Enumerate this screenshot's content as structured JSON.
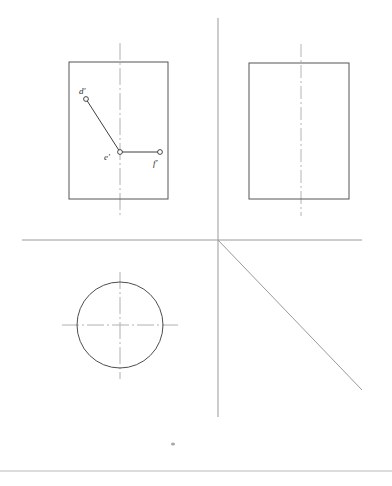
{
  "sheet": {
    "width": 392,
    "height": 486,
    "background": "#ffffff",
    "title": "Orthographic projection — three-view layout with point path d'-e'-f'"
  },
  "colors": {
    "outline": "#555555",
    "axis": "#9a9a9a",
    "centerline": "#b0b0b0",
    "circle": "#4d4d4d",
    "segment": "#3f3f3f",
    "node_fill": "#ffffff",
    "node_stroke": "#333333",
    "label": "#2b2b2b",
    "border": "#b9b9b9",
    "speck": "#a9a9a9"
  },
  "axes": {
    "horizontal": {
      "name": "ground-line",
      "x1": 22,
      "y1": 240,
      "x2": 362,
      "y2": 240
    },
    "vertical": {
      "name": "folding-line",
      "x1": 218,
      "y1": 18,
      "x2": 218,
      "y2": 417
    },
    "miter": {
      "name": "miter-line-45deg",
      "x1": 218,
      "y1": 240,
      "x2": 362,
      "y2": 390,
      "angle_deg": 45
    },
    "origin": {
      "x": 218,
      "y": 240
    }
  },
  "views": {
    "front": {
      "name": "front-view",
      "rect": {
        "x": 69,
        "y": 62,
        "width": 99,
        "height": 137
      },
      "centerline": {
        "x": 120,
        "y1": 43,
        "y2": 216
      }
    },
    "side": {
      "name": "side-view",
      "rect": {
        "x": 249,
        "y": 63,
        "width": 100,
        "height": 136
      },
      "centerline": {
        "x": 301,
        "y1": 44,
        "y2": 216
      }
    },
    "top": {
      "name": "top-view",
      "circle": {
        "cx": 120,
        "cy": 325,
        "r": 43
      },
      "centerline_v": {
        "x": 120,
        "y1": 272,
        "y2": 379
      },
      "centerline_h": {
        "y": 325,
        "x1": 62,
        "x2": 178
      }
    }
  },
  "points": [
    {
      "id": "d-prime",
      "label": "d'",
      "x": 86,
      "y": 99,
      "label_x": 79,
      "label_y": 94,
      "radius": 2.4
    },
    {
      "id": "e-prime",
      "label": "e'",
      "x": 120,
      "y": 152,
      "label_x": 104,
      "label_y": 160,
      "radius": 2.4
    },
    {
      "id": "f-prime",
      "label": "f'",
      "x": 160,
      "y": 152,
      "label_x": 153,
      "label_y": 166,
      "radius": 2.4
    }
  ],
  "segments": [
    {
      "id": "segment-de",
      "from": "d-prime",
      "to": "e-prime",
      "x1": 86,
      "y1": 99,
      "x2": 120,
      "y2": 152
    },
    {
      "id": "segment-ef",
      "from": "e-prime",
      "to": "f-prime",
      "x1": 120,
      "y1": 152,
      "x2": 160,
      "y2": 152
    }
  ],
  "marks": {
    "speck": {
      "cx": 173,
      "cy": 444,
      "rx": 2.1,
      "ry": 1.5
    },
    "page_border": {
      "x1": 0,
      "y1": 471,
      "x2": 392,
      "y2": 471
    }
  },
  "chart_data": {
    "type": "table",
    "xlabel": "",
    "ylabel": "",
    "categories": [
      "d'",
      "e'",
      "f'"
    ],
    "series": [
      {
        "name": "x-coordinate (px)",
        "values": [
          86,
          120,
          160
        ]
      },
      {
        "name": "y-coordinate (px)",
        "values": [
          99,
          152,
          152
        ]
      }
    ],
    "annotations": [
      "front view rectangle 99x137 at (69,62)",
      "side view rectangle 100x136 at (249,63)",
      "top view circle r=43 at (120,325)",
      "ground line y=240, folding line x=218, miter line 45deg from (218,240)"
    ],
    "grid": false,
    "legend_position": "none"
  }
}
